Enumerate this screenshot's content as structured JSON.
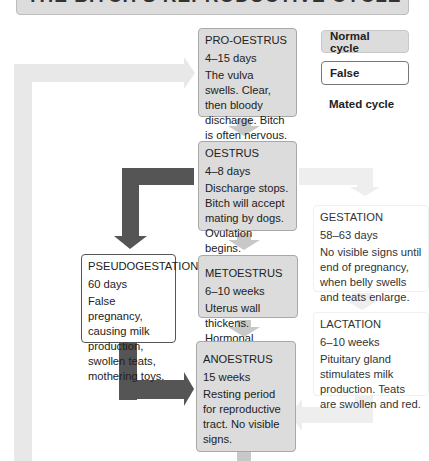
{
  "title": "THE BITCH'S REPRODUCTIVE CYCLE",
  "legend": {
    "normal": "Normal cycle",
    "false": "False",
    "mated": "Mated cycle"
  },
  "colors": {
    "normal_box": "#dcdcdc",
    "normal_arrow": "#c8c8c8",
    "false_arrow": "#555555",
    "mated_arrow": "#eeeeee",
    "cycle_loop_arrow": "#e6e6e6"
  },
  "stages": {
    "pro_oestrus": {
      "name": "PRO-OESTRUS",
      "duration": "4–15 days",
      "description": "The vulva swells. Clear, then bloody discharge. Bitch is often nervous.",
      "cycle": "normal"
    },
    "oestrus": {
      "name": "OESTRUS",
      "duration": "4–8 days",
      "description": "Discharge stops. Bitch will accept mating by dogs. Ovulation begins.",
      "cycle": "normal"
    },
    "metoestrus": {
      "name": "METOESTRUS",
      "duration": "6–10 weeks",
      "description": "Uterus wall thickens. Hormonal changes. No visible signs.",
      "cycle": "normal"
    },
    "anoestrus": {
      "name": "ANOESTRUS",
      "duration": "15 weeks",
      "description": "Resting period for reproductive tract. No visible signs.",
      "cycle": "normal"
    },
    "pseudogestation": {
      "name": "PSEUDOGESTATION",
      "duration": "60 days",
      "description": "False pregnancy, causing milk production, swollen teats, mothering toys.",
      "cycle": "false"
    },
    "gestation": {
      "name": "GESTATION",
      "duration": "58–63 days",
      "description": "No visible signs until end of pregnancy, when belly swells and teats enlarge.",
      "cycle": "mated"
    },
    "lactation": {
      "name": "LACTATION",
      "duration": "6–10 weeks",
      "description": "Pituitary gland stimulates milk production. Teats are swollen and red.",
      "cycle": "mated"
    }
  }
}
